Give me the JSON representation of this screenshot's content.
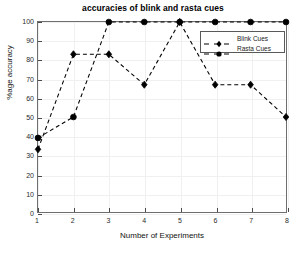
{
  "chart_data": {
    "type": "line",
    "title": "accuracies of blink and rasta cues",
    "xlabel": "Number of Experiments",
    "ylabel": "%age accuracy",
    "x": [
      1,
      2,
      3,
      4,
      5,
      6,
      7,
      8
    ],
    "xticks": [
      "1",
      "2",
      "3",
      "4",
      "5",
      "6",
      "7",
      "8"
    ],
    "yticks": [
      "0",
      "10",
      "20",
      "30",
      "40",
      "50",
      "60",
      "70",
      "80",
      "90",
      "100"
    ],
    "xlim": [
      1,
      8
    ],
    "ylim": [
      0,
      100
    ],
    "grid": true,
    "legend_position": "upper right",
    "series": [
      {
        "name": "Blink Cues",
        "marker": "diamond",
        "linestyle": "dashed",
        "color": "#000000",
        "values": [
          33,
          83,
          83,
          67,
          100,
          67,
          67,
          50
        ]
      },
      {
        "name": "Rasta Cues",
        "marker": "circle",
        "linestyle": "dashed",
        "color": "#000000",
        "values": [
          39,
          50,
          100,
          100,
          100,
          100,
          100,
          100
        ]
      }
    ]
  },
  "legend": {
    "items": [
      {
        "label": "Blink Cues",
        "marker": "diamond-marker-icon"
      },
      {
        "label": "Rasta Cues",
        "marker": "circle-marker-icon"
      }
    ]
  },
  "colors": {
    "axis": "#6e6e6e",
    "grid": "#eef0f2",
    "series": "#000000",
    "background": "#ffffff",
    "text": "#111111"
  }
}
